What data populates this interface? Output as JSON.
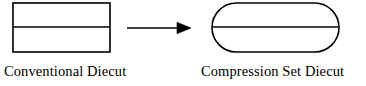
{
  "figure": {
    "background_color": "#ffffff",
    "stroke_color": "#000000",
    "stroke_width": 1.6
  },
  "shapes": {
    "conventional": {
      "type": "rectangle",
      "label": "Conventional Diecut",
      "x": 13,
      "y": 3,
      "width": 97,
      "height": 49,
      "divider_y": 27,
      "fill": "none"
    },
    "compression_set": {
      "type": "stadium",
      "label": "Compression Set Diecut",
      "x": 212,
      "y": 3,
      "width": 127,
      "height": 49,
      "corner_radius": 24.5,
      "divider_y": 27,
      "fill": "none"
    }
  },
  "arrow": {
    "name": "transformation-arrow",
    "direction": "right",
    "x_start": 127,
    "x_end": 191,
    "y": 28,
    "head_length": 13,
    "head_half_width": 6
  },
  "captions": {
    "left": "Conventional Diecut",
    "right": "Compression Set Diecut"
  }
}
